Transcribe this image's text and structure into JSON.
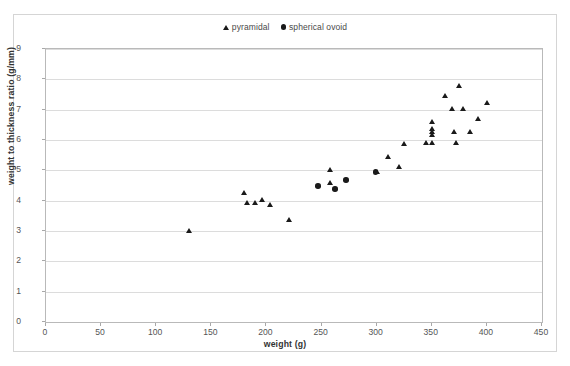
{
  "chart_data": {
    "type": "scatter",
    "title": "",
    "xlabel": "weight (g)",
    "ylabel": "weight to thickness ratio (g/mm)",
    "xlim": [
      0,
      450
    ],
    "ylim": [
      0,
      9
    ],
    "xticks": [
      0,
      50,
      100,
      150,
      200,
      250,
      300,
      350,
      400,
      450
    ],
    "yticks": [
      0,
      1,
      2,
      3,
      4,
      5,
      6,
      7,
      8,
      9
    ],
    "grid": "horizontal",
    "legend_position": "top-center",
    "series": [
      {
        "name": "pyramidal",
        "marker": "triangle",
        "color": "#1a1a1a",
        "points": [
          [
            130,
            3.02
          ],
          [
            180,
            4.25
          ],
          [
            182,
            3.95
          ],
          [
            190,
            3.92
          ],
          [
            196,
            4.02
          ],
          [
            203,
            3.88
          ],
          [
            221,
            3.38
          ],
          [
            258,
            5.02
          ],
          [
            258,
            4.58
          ],
          [
            300,
            4.95
          ],
          [
            310,
            5.45
          ],
          [
            320,
            5.12
          ],
          [
            325,
            5.88
          ],
          [
            345,
            5.92
          ],
          [
            350,
            6.62
          ],
          [
            350,
            6.38
          ],
          [
            350,
            6.28
          ],
          [
            350,
            6.18
          ],
          [
            350,
            5.92
          ],
          [
            362,
            7.48
          ],
          [
            368,
            7.05
          ],
          [
            370,
            6.28
          ],
          [
            372,
            5.92
          ],
          [
            375,
            7.78
          ],
          [
            378,
            7.02
          ],
          [
            385,
            6.28
          ],
          [
            392,
            6.72
          ],
          [
            400,
            7.22
          ]
        ]
      },
      {
        "name": "spherical ovoid",
        "marker": "circle",
        "color": "#1a1a1a",
        "points": [
          [
            247,
            4.48
          ],
          [
            262,
            4.38
          ],
          [
            272,
            4.68
          ],
          [
            299,
            4.95
          ]
        ]
      }
    ]
  },
  "legend": {
    "entries": [
      {
        "label": "pyramidal",
        "marker": "triangle"
      },
      {
        "label": "spherical ovoid",
        "marker": "circle"
      }
    ]
  },
  "axes": {
    "x_title": "weight (g)",
    "y_title": "weight to thickness ratio (g/mm)"
  },
  "clipped_top_text": ""
}
